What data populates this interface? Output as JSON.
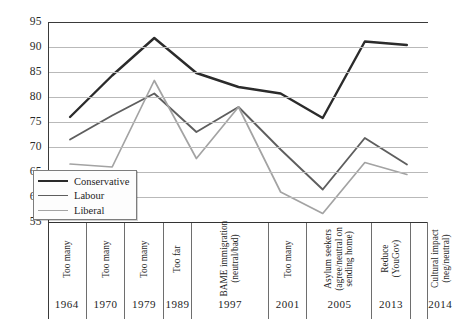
{
  "chart_data": {
    "type": "line",
    "title": "",
    "xlabel": "",
    "ylabel": "",
    "ylim": [
      55,
      95
    ],
    "yticks": [
      95,
      90,
      85,
      80,
      75,
      70,
      65,
      60,
      55
    ],
    "grid": true,
    "legend_position": "inside-left-lower",
    "categories": [
      "Too many",
      "Too many",
      "Too many",
      "Too far",
      "BAME immigration (neutral/bad)",
      "Too many",
      "Asylum seekers (agree/neutral on sending home)",
      "Reduce (YouGov)",
      "Cultural impact (neg/neutral)"
    ],
    "category_lines": [
      [
        "Too many"
      ],
      [
        "Too many"
      ],
      [
        "Too many"
      ],
      [
        "Too far"
      ],
      [
        "BAME immigration",
        "(neutral/bad)"
      ],
      [
        "Too many"
      ],
      [
        "Asylum seekers",
        "(agree/neutral on",
        "sending home)"
      ],
      [
        "Reduce",
        "(YouGov)"
      ],
      [
        "Cultural impact",
        "(neg/neutral)"
      ]
    ],
    "years": [
      "1964",
      "1970",
      "1979",
      "1989",
      "1997",
      "2001",
      "2005",
      "2013",
      "2014"
    ],
    "series": [
      {
        "name": "Conservative",
        "color": "#2b2b2b",
        "width": 2.4,
        "values": [
          76.0,
          84.3,
          91.8,
          84.8,
          82.0,
          80.7,
          75.8,
          91.1,
          90.4
        ]
      },
      {
        "name": "Labour",
        "color": "#5e5e5e",
        "width": 1.9,
        "values": [
          71.5,
          76.3,
          80.7,
          73.0,
          78.0,
          69.5,
          61.5,
          71.8,
          66.5
        ]
      },
      {
        "name": "Liberal",
        "color": "#a3a3a3",
        "width": 1.7,
        "values": [
          66.6,
          66.0,
          83.3,
          67.7,
          78.0,
          61.0,
          56.7,
          66.9,
          64.5
        ]
      }
    ]
  },
  "legend": {
    "items": [
      {
        "label": "Conservative",
        "color": "#2b2b2b",
        "width": 2.4
      },
      {
        "label": "Labour",
        "color": "#5e5e5e",
        "width": 1.9
      },
      {
        "label": "Liberal",
        "color": "#a3a3a3",
        "width": 1.7
      }
    ]
  }
}
